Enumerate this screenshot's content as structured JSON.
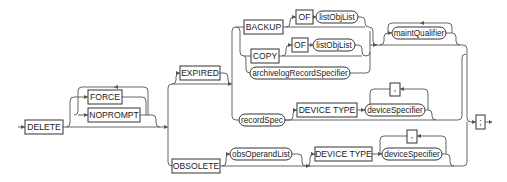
{
  "diagram": {
    "type": "syntax-railroad",
    "keywords": {
      "delete": "DELETE",
      "force": "FORCE",
      "noprompt": "NOPROMPT",
      "expired": "EXPIRED",
      "obsolete": "OBSOLETE",
      "backup": "BACKUP",
      "copy": "COPY",
      "of1": "OF",
      "of2": "OF",
      "device_type1": "DEVICE TYPE",
      "device_type2": "DEVICE TYPE",
      "comma1": ",",
      "comma2": ",",
      "terminator": ";"
    },
    "nonterminals": {
      "listobjlist1": "listObjList",
      "listobjlist2": "listObjList",
      "archivelog": "archivelogRecordSpecifier",
      "maintqualifier": "maintQualifier",
      "recordspec": "recordSpec",
      "devicespecifier1": "deviceSpecifier",
      "devicespecifier2": "deviceSpecifier",
      "obsoperandlist": "obsOperandList"
    }
  }
}
